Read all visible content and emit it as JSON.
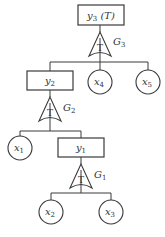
{
  "diagram": {
    "type": "fault-tree",
    "colors": {
      "stroke": "#3a3a3a",
      "background": "#ffffff",
      "text": "#333333"
    },
    "nodes": [
      {
        "id": "y3",
        "kind": "event-box",
        "label": "y",
        "sub": "3",
        "suffix": " (T)"
      },
      {
        "id": "G3",
        "kind": "gate",
        "symbol": "T",
        "label": "G",
        "sub": "3"
      },
      {
        "id": "y2",
        "kind": "event-box",
        "label": "y",
        "sub": "2"
      },
      {
        "id": "x4",
        "kind": "basic-event",
        "label": "x",
        "sub": "4"
      },
      {
        "id": "x5",
        "kind": "basic-event",
        "label": "x",
        "sub": "5"
      },
      {
        "id": "G2",
        "kind": "gate",
        "symbol": "T",
        "label": "G",
        "sub": "2"
      },
      {
        "id": "x1",
        "kind": "basic-event",
        "label": "x",
        "sub": "1"
      },
      {
        "id": "y1",
        "kind": "event-box",
        "label": "y",
        "sub": "1"
      },
      {
        "id": "G1",
        "kind": "gate",
        "symbol": "T",
        "label": "G",
        "sub": "1"
      },
      {
        "id": "x2",
        "kind": "basic-event",
        "label": "x",
        "sub": "2"
      },
      {
        "id": "x3",
        "kind": "basic-event",
        "label": "x",
        "sub": "3"
      }
    ],
    "edges": [
      [
        "y3",
        "G3"
      ],
      [
        "G3",
        "y2"
      ],
      [
        "G3",
        "x4"
      ],
      [
        "G3",
        "x5"
      ],
      [
        "y2",
        "G2"
      ],
      [
        "G2",
        "x1"
      ],
      [
        "G2",
        "y1"
      ],
      [
        "y1",
        "G1"
      ],
      [
        "G1",
        "x2"
      ],
      [
        "G1",
        "x3"
      ]
    ],
    "n": {
      "y3": {
        "l": "y",
        "s": "3",
        "t": " (T)"
      },
      "G3": {
        "sym": "T",
        "l": "G",
        "s": "3"
      },
      "y2": {
        "l": "y",
        "s": "2"
      },
      "x4": {
        "l": "x",
        "s": "4"
      },
      "x5": {
        "l": "x",
        "s": "5"
      },
      "G2": {
        "sym": "T",
        "l": "G",
        "s": "2"
      },
      "x1": {
        "l": "x",
        "s": "1"
      },
      "y1": {
        "l": "y",
        "s": "1"
      },
      "G1": {
        "sym": "T",
        "l": "G",
        "s": "1"
      },
      "x2": {
        "l": "x",
        "s": "2"
      },
      "x3": {
        "l": "x",
        "s": "3"
      }
    }
  }
}
